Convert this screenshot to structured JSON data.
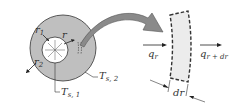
{
  "diagram": {
    "colors": {
      "wall_fill": "#bfbfbf",
      "outline": "#333333",
      "element_fill": "#ececec",
      "arrow_fill": "#8a8a8a",
      "background": "#ffffff"
    },
    "labels": {
      "r1": "r",
      "r1_sub": "1",
      "r": "r",
      "r2": "r",
      "r2_sub": "2",
      "ts2": "T",
      "ts2_sub": "s, 2",
      "ts1": "T",
      "ts1_sub": "s, 1",
      "qr": "q",
      "qr_sub": "r",
      "qrdr": "q",
      "qrdr_sub": "r + dr",
      "dr": "dr"
    }
  }
}
